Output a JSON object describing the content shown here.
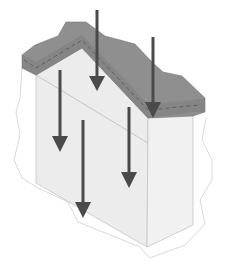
{
  "diagram": {
    "colors": {
      "background": "#ffffff",
      "outline": "#c8c8c8",
      "block_face": "#ececec",
      "block_side": "#f1f1f1",
      "top_layer": "#8f8f8f",
      "top_layer_side": "#7a7a7a",
      "dashed_line": "#555555",
      "arrow": "#4a4a4a"
    },
    "arrows": [
      {
        "id": "arrow-1",
        "x": 97,
        "y1": 10,
        "y2": 90
      },
      {
        "id": "arrow-2",
        "x": 153,
        "y1": 37,
        "y2": 118
      },
      {
        "id": "arrow-3",
        "x": 60,
        "y1": 70,
        "y2": 152
      },
      {
        "id": "arrow-4",
        "x": 83,
        "y1": 120,
        "y2": 218
      },
      {
        "id": "arrow-5",
        "x": 129,
        "y1": 107,
        "y2": 188
      }
    ]
  }
}
